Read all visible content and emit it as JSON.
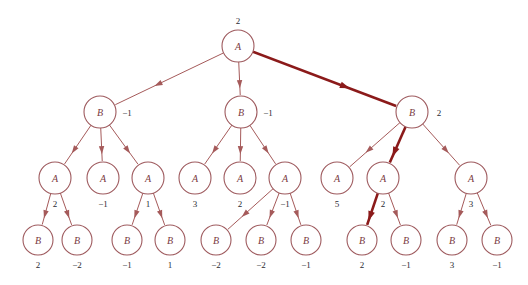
{
  "figure": {
    "name": "minimax-game-tree",
    "background_color": "#ffffff",
    "edge_color": "#A55A5A",
    "highlight_color": "#8B1A1A",
    "node_stroke_color": "#9E5A5E",
    "node_label_color": "#7A3B3F",
    "value_text_color": "#2b2b33"
  },
  "chart_data": {
    "type": "diagram",
    "title": "",
    "node_radius": 16,
    "leaf_radius": 15,
    "levels": [
      {
        "depth": 0,
        "player": "A",
        "y": 46,
        "nodes": [
          {
            "id": "r",
            "label": "A",
            "value": "2",
            "x": 238,
            "value_pos": "above"
          }
        ]
      },
      {
        "depth": 1,
        "player": "B",
        "y": 112,
        "nodes": [
          {
            "id": "b1",
            "label": "B",
            "value": "-1",
            "x": 100,
            "value_pos": "right"
          },
          {
            "id": "b2",
            "label": "B",
            "value": "-1",
            "x": 241,
            "value_pos": "right"
          },
          {
            "id": "b3",
            "label": "B",
            "value": "2",
            "x": 412,
            "value_pos": "right"
          }
        ]
      },
      {
        "depth": 2,
        "player": "A",
        "y": 178,
        "nodes": [
          {
            "id": "a1",
            "label": "A",
            "value": "2",
            "x": 55,
            "value_pos": "below"
          },
          {
            "id": "a2",
            "label": "A",
            "value": "-1",
            "x": 103,
            "value_pos": "below"
          },
          {
            "id": "a3",
            "label": "A",
            "value": "1",
            "x": 148,
            "value_pos": "below"
          },
          {
            "id": "a4",
            "label": "A",
            "value": "3",
            "x": 195,
            "value_pos": "below"
          },
          {
            "id": "a5",
            "label": "A",
            "value": "2",
            "x": 240,
            "value_pos": "below"
          },
          {
            "id": "a6",
            "label": "A",
            "value": "-1",
            "x": 285,
            "value_pos": "below"
          },
          {
            "id": "a7",
            "label": "A",
            "value": "5",
            "x": 337,
            "value_pos": "below"
          },
          {
            "id": "a8",
            "label": "A",
            "value": "2",
            "x": 383,
            "value_pos": "below"
          },
          {
            "id": "a9",
            "label": "A",
            "value": "3",
            "x": 471,
            "value_pos": "below"
          }
        ]
      },
      {
        "depth": 3,
        "player": "B",
        "y": 240,
        "nodes": [
          {
            "id": "l1",
            "label": "B",
            "value": "2",
            "x": 38,
            "value_pos": "below"
          },
          {
            "id": "l2",
            "label": "B",
            "value": "-2",
            "x": 77,
            "value_pos": "below"
          },
          {
            "id": "l3",
            "label": "B",
            "value": "-1",
            "x": 127,
            "value_pos": "below"
          },
          {
            "id": "l4",
            "label": "B",
            "value": "1",
            "x": 170,
            "value_pos": "below"
          },
          {
            "id": "l5",
            "label": "B",
            "value": "-2",
            "x": 216,
            "value_pos": "below"
          },
          {
            "id": "l6",
            "label": "B",
            "value": "-2",
            "x": 261,
            "value_pos": "below"
          },
          {
            "id": "l7",
            "label": "B",
            "value": "-1",
            "x": 306,
            "value_pos": "below"
          },
          {
            "id": "l8",
            "label": "B",
            "value": "2",
            "x": 362,
            "value_pos": "below"
          },
          {
            "id": "l9",
            "label": "B",
            "value": "-1",
            "x": 406,
            "value_pos": "below"
          },
          {
            "id": "l10",
            "label": "B",
            "value": "3",
            "x": 452,
            "value_pos": "below"
          },
          {
            "id": "l11",
            "label": "B",
            "value": "-1",
            "x": 497,
            "value_pos": "below"
          }
        ]
      }
    ],
    "edges": [
      {
        "from": "r",
        "to": "b1",
        "highlight": false
      },
      {
        "from": "r",
        "to": "b2",
        "highlight": false
      },
      {
        "from": "r",
        "to": "b3",
        "highlight": true
      },
      {
        "from": "b1",
        "to": "a1",
        "highlight": false
      },
      {
        "from": "b1",
        "to": "a2",
        "highlight": false
      },
      {
        "from": "b1",
        "to": "a3",
        "highlight": false
      },
      {
        "from": "b2",
        "to": "a4",
        "highlight": false
      },
      {
        "from": "b2",
        "to": "a5",
        "highlight": false
      },
      {
        "from": "b2",
        "to": "a6",
        "highlight": false
      },
      {
        "from": "b3",
        "to": "a7",
        "highlight": false
      },
      {
        "from": "b3",
        "to": "a8",
        "highlight": true
      },
      {
        "from": "b3",
        "to": "a9",
        "highlight": false
      },
      {
        "from": "a1",
        "to": "l1",
        "highlight": false
      },
      {
        "from": "a1",
        "to": "l2",
        "highlight": false
      },
      {
        "from": "a3",
        "to": "l3",
        "highlight": false
      },
      {
        "from": "a3",
        "to": "l4",
        "highlight": false
      },
      {
        "from": "a6",
        "to": "l5",
        "highlight": false
      },
      {
        "from": "a6",
        "to": "l6",
        "highlight": false
      },
      {
        "from": "a6",
        "to": "l7",
        "highlight": false
      },
      {
        "from": "a8",
        "to": "l8",
        "highlight": true
      },
      {
        "from": "a8",
        "to": "l9",
        "highlight": false
      },
      {
        "from": "a9",
        "to": "l10",
        "highlight": false
      },
      {
        "from": "a9",
        "to": "l11",
        "highlight": false
      }
    ]
  }
}
